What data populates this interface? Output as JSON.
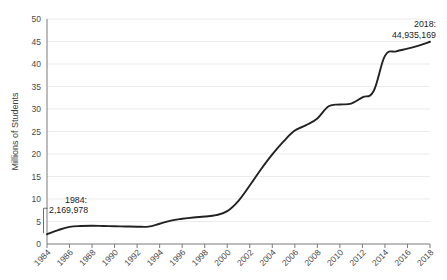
{
  "chart_data": {
    "type": "line",
    "title": "",
    "xlabel": "",
    "ylabel": "Millions of Students",
    "ylim": [
      0,
      50
    ],
    "xlim": [
      1984,
      2018
    ],
    "ytick_step": 5,
    "grid": true,
    "grid_axis": "y",
    "legend": false,
    "line_color": "#222222",
    "grid_color": "#ebebeb",
    "axis_color": "#7a7a7a",
    "ytick_labels": [
      "0",
      "5",
      "10",
      "15",
      "20",
      "25",
      "30",
      "35",
      "40",
      "45",
      "50"
    ],
    "xtick_labels": [
      "1984",
      "1986",
      "1988",
      "1990",
      "1992",
      "1994",
      "1996",
      "1998",
      "2000",
      "2002",
      "2004",
      "2006",
      "2008",
      "2010",
      "2012",
      "2014",
      "2016",
      "2018"
    ],
    "x": [
      1984,
      1985,
      1986,
      1987,
      1988,
      1989,
      1990,
      1991,
      1992,
      1993,
      1994,
      1995,
      1996,
      1997,
      1998,
      1999,
      2000,
      2001,
      2002,
      2003,
      2004,
      2005,
      2006,
      2007,
      2008,
      2009,
      2010,
      2011,
      2012,
      2013,
      2014,
      2015,
      2016,
      2017,
      2018
    ],
    "values": [
      2.17,
      3.1,
      3.8,
      4.0,
      4.05,
      4.0,
      3.95,
      3.9,
      3.85,
      3.85,
      4.5,
      5.2,
      5.6,
      5.9,
      6.1,
      6.4,
      7.3,
      9.6,
      13.0,
      16.6,
      19.9,
      22.8,
      25.2,
      26.4,
      27.9,
      30.6,
      31.0,
      31.2,
      32.6,
      34.0,
      41.8,
      42.8,
      43.4,
      44.1,
      44.94
    ],
    "annotations": [
      {
        "name": "start-annotation",
        "year_label": "1984:",
        "value_label": "2,169,978",
        "year": 1984,
        "value": 2.169978
      },
      {
        "name": "end-annotation",
        "year_label": "2018:",
        "value_label": "44,935,169",
        "year": 2018,
        "value": 44.935169
      }
    ]
  }
}
